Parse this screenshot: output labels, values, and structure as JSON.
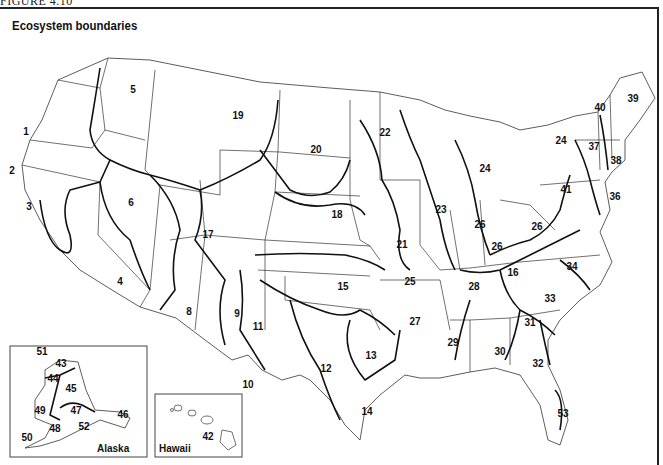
{
  "figure_label": "FIGURE 4.10",
  "title": "Ecosystem boundaries",
  "insets": {
    "alaska": {
      "label": "Alaska",
      "regions": [
        "43",
        "44",
        "45",
        "46",
        "47",
        "48",
        "49",
        "50",
        "51",
        "52"
      ]
    },
    "hawaii": {
      "label": "Hawaii",
      "regions": [
        "42"
      ]
    }
  },
  "regions": [
    {
      "id": "1",
      "x": 26,
      "y": 135
    },
    {
      "id": "2",
      "x": 12,
      "y": 174
    },
    {
      "id": "3",
      "x": 29,
      "y": 210
    },
    {
      "id": "4",
      "x": 120,
      "y": 285
    },
    {
      "id": "5",
      "x": 133,
      "y": 93
    },
    {
      "id": "6",
      "x": 131,
      "y": 206
    },
    {
      "id": "8",
      "x": 189,
      "y": 315
    },
    {
      "id": "9",
      "x": 237,
      "y": 317
    },
    {
      "id": "10",
      "x": 248,
      "y": 388
    },
    {
      "id": "11",
      "x": 258,
      "y": 330
    },
    {
      "id": "12",
      "x": 326,
      "y": 372
    },
    {
      "id": "13",
      "x": 371,
      "y": 359
    },
    {
      "id": "14",
      "x": 367,
      "y": 415
    },
    {
      "id": "15",
      "x": 343,
      "y": 290
    },
    {
      "id": "16",
      "x": 513,
      "y": 276
    },
    {
      "id": "17",
      "x": 208,
      "y": 238
    },
    {
      "id": "18",
      "x": 337,
      "y": 218
    },
    {
      "id": "19",
      "x": 238,
      "y": 119
    },
    {
      "id": "20",
      "x": 316,
      "y": 153
    },
    {
      "id": "21",
      "x": 402,
      "y": 248
    },
    {
      "id": "22",
      "x": 385,
      "y": 136
    },
    {
      "id": "23",
      "x": 441,
      "y": 213
    },
    {
      "id": "24",
      "x": 485,
      "y": 172
    },
    {
      "id": "24",
      "x": 561,
      "y": 144
    },
    {
      "id": "25",
      "x": 410,
      "y": 285
    },
    {
      "id": "26",
      "x": 480,
      "y": 228
    },
    {
      "id": "26",
      "x": 497,
      "y": 250
    },
    {
      "id": "26",
      "x": 537,
      "y": 230
    },
    {
      "id": "27",
      "x": 415,
      "y": 325
    },
    {
      "id": "28",
      "x": 474,
      "y": 290
    },
    {
      "id": "29",
      "x": 453,
      "y": 346
    },
    {
      "id": "30",
      "x": 500,
      "y": 355
    },
    {
      "id": "31",
      "x": 530,
      "y": 326
    },
    {
      "id": "32",
      "x": 538,
      "y": 367
    },
    {
      "id": "33",
      "x": 550,
      "y": 302
    },
    {
      "id": "34",
      "x": 572,
      "y": 270
    },
    {
      "id": "36",
      "x": 615,
      "y": 200
    },
    {
      "id": "37",
      "x": 594,
      "y": 150
    },
    {
      "id": "38",
      "x": 616,
      "y": 164
    },
    {
      "id": "39",
      "x": 633,
      "y": 102
    },
    {
      "id": "40",
      "x": 600,
      "y": 111
    },
    {
      "id": "41",
      "x": 566,
      "y": 193
    },
    {
      "id": "42",
      "x": 208,
      "y": 440
    },
    {
      "id": "43",
      "x": 61,
      "y": 367
    },
    {
      "id": "44",
      "x": 53,
      "y": 382
    },
    {
      "id": "45",
      "x": 71,
      "y": 392
    },
    {
      "id": "46",
      "x": 123,
      "y": 418
    },
    {
      "id": "47",
      "x": 76,
      "y": 414
    },
    {
      "id": "48",
      "x": 55,
      "y": 432
    },
    {
      "id": "49",
      "x": 40,
      "y": 414
    },
    {
      "id": "50",
      "x": 27,
      "y": 441
    },
    {
      "id": "51",
      "x": 42,
      "y": 355
    },
    {
      "id": "52",
      "x": 84,
      "y": 430
    },
    {
      "id": "53",
      "x": 563,
      "y": 417
    }
  ]
}
